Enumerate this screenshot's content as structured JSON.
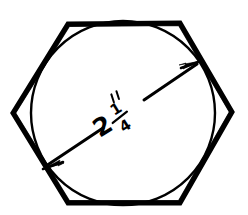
{
  "drawing": {
    "title": "Hexagon with inscribed circle and across-flats dimension",
    "background_color": "#ffffff",
    "ink_color": "#000000",
    "dimension": {
      "whole": "2",
      "numerator": "1",
      "denominator": "4",
      "unit_symbol": "″",
      "full_label": "2 1/4″",
      "measures": "across-flats diameter of inscribed circle"
    },
    "shapes": {
      "hexagon": {
        "name": "hexagon",
        "stroke_width_px": 5,
        "vertices": "68,24 180,23 232,112 180,203 68,203 13,113"
      },
      "circle": {
        "name": "inscribed-circle",
        "stroke_width_px": 2.4,
        "center_x": 123,
        "center_y": 113,
        "radius": 92
      },
      "dimension_arrow": {
        "name": "dimension-arrow",
        "stroke_width_px": 3,
        "start_x": 44,
        "start_y": 167,
        "end_x": 199,
        "end_y": 63,
        "double_headed": true
      }
    }
  }
}
